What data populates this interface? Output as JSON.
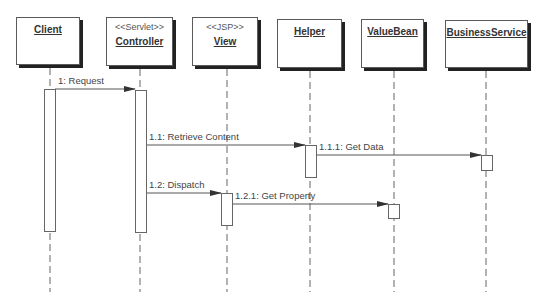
{
  "diagram": {
    "type": "uml-sequence",
    "participants": [
      {
        "id": "client",
        "name": "Client",
        "stereotype": "",
        "box": {
          "x": 16,
          "y": 17,
          "w": 64,
          "h": 48
        },
        "lifeline_x": 50
      },
      {
        "id": "controller",
        "name": "Controller",
        "stereotype": "<<Servlet>>",
        "box": {
          "x": 106,
          "y": 17,
          "w": 67,
          "h": 49
        },
        "lifeline_x": 140
      },
      {
        "id": "view",
        "name": "View",
        "stereotype": "<<JSP>>",
        "box": {
          "x": 192,
          "y": 17,
          "w": 66,
          "h": 49
        },
        "lifeline_x": 227
      },
      {
        "id": "helper",
        "name": "Helper",
        "stereotype": "",
        "box": {
          "x": 277,
          "y": 19,
          "w": 65,
          "h": 49
        },
        "lifeline_x": 310
      },
      {
        "id": "valuebean",
        "name": "ValueBean",
        "stereotype": "",
        "box": {
          "x": 361,
          "y": 19,
          "w": 63,
          "h": 49
        },
        "lifeline_x": 394
      },
      {
        "id": "businessservice",
        "name": "BusinessService",
        "stereotype": "",
        "box": {
          "x": 445,
          "y": 20,
          "w": 83,
          "h": 48
        },
        "lifeline_x": 486
      }
    ],
    "lifeline_end_y": 292,
    "activations": [
      {
        "participant": "client",
        "x": 44,
        "y": 89,
        "w": 11,
        "h": 142
      },
      {
        "participant": "controller",
        "x": 135,
        "y": 90,
        "w": 11,
        "h": 142
      },
      {
        "participant": "helper",
        "x": 305,
        "y": 145,
        "w": 11,
        "h": 32
      },
      {
        "participant": "businessservice",
        "x": 481,
        "y": 155,
        "w": 11,
        "h": 15
      },
      {
        "participant": "view",
        "x": 221,
        "y": 193,
        "w": 11,
        "h": 32
      },
      {
        "participant": "valuebean",
        "x": 388,
        "y": 204,
        "w": 11,
        "h": 14
      }
    ],
    "messages": [
      {
        "label": "1: Request",
        "from_x": 55,
        "to_x": 135,
        "y": 89,
        "label_x": 58,
        "label_y": 75
      },
      {
        "label": "1.1: Retrieve Content",
        "from_x": 146,
        "to_x": 305,
        "y": 145,
        "label_x": 149,
        "label_y": 131
      },
      {
        "label": "1.1.1: Get Data",
        "from_x": 316,
        "to_x": 481,
        "y": 155,
        "label_x": 319,
        "label_y": 141
      },
      {
        "label": "1.2: Dispatch",
        "from_x": 146,
        "to_x": 221,
        "y": 193,
        "label_x": 149,
        "label_y": 179
      },
      {
        "label": "1.2.1: Get Property",
        "from_x": 232,
        "to_x": 388,
        "y": 204,
        "label_x": 235,
        "label_y": 190
      }
    ]
  }
}
